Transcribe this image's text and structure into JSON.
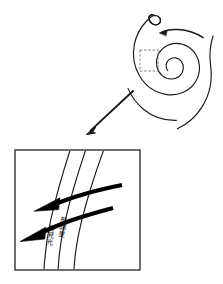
{
  "figure": {
    "background_color": "#ffffff",
    "stroke_color": "#000000",
    "width": 223,
    "height": 284
  },
  "spiral": {
    "name": "spiral-pattern",
    "description": "Two-armed logarithmic spiral drawn with thin black strokes, wound counter-clockwise toward a tight center",
    "center": {
      "x": 162,
      "y": 70
    },
    "arm_count": 2,
    "line_color": "#1a1a1a",
    "line_width": "1.1"
  },
  "rotation_arrow": {
    "name": "rotation-direction-arrow",
    "description": "Curved arrow above the spiral core indicating direction of rotation",
    "direction": "counter-clockwise",
    "points_to": "left"
  },
  "loop_marker": {
    "name": "spiral-outer-loop",
    "description": "Small teardrop loop at the top end of the outer spiral arm"
  },
  "inset_box": {
    "name": "inset-selection-box",
    "style": "dashed",
    "color": "#666666",
    "x": 140,
    "y": 50,
    "width": 18,
    "height": 21
  },
  "zoom_arrow": {
    "name": "zoom-pointer-arrow",
    "description": "Straight diagonal arrow leading from the dashed inset box down-left to the magnified detail panel",
    "from": {
      "x": 133,
      "y": 91
    },
    "to": {
      "x": 87,
      "y": 134
    }
  },
  "detail_panel": {
    "name": "magnified-detail-panel",
    "border_color": "#222222",
    "x": 15,
    "y": 150,
    "width": 125,
    "height": 120,
    "arm_lines": {
      "name": "spiral-arm-lines",
      "count": 3,
      "description": "Three thin curved lines running top-right to bottom-left representing spiral arm / shock fronts"
    },
    "flow_arrows": {
      "name": "gas-flow-arrows",
      "count": 2,
      "description": "Two thick black arrows crossing the arm lines, pointing to the lower left, representing gas flow across the shock",
      "direction": "left"
    },
    "labels": [
      {
        "name": "label-arm-inner",
        "text": "可見光",
        "orientation": "vertical"
      },
      {
        "name": "label-arm-outer",
        "text": "船總星",
        "orientation": "vertical"
      }
    ]
  }
}
